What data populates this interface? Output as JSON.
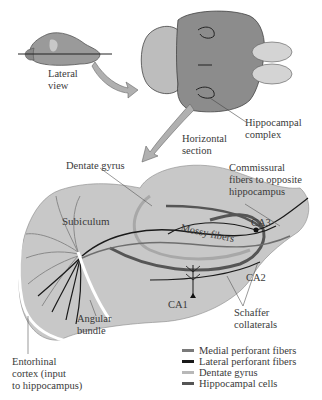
{
  "figure": {
    "labels": {
      "lateral_view": "Lateral\nview",
      "horizontal_section": "Horizontal\nsection",
      "hippocampal_complex": "Hippocampal\ncomplex",
      "dentate_gyrus": "Dentate gyrus",
      "commissural_fibers": "Commissural\nfibers to opposite\nhippocampus",
      "subiculum": "Subiculum",
      "mossy_fibers": "Mossy fibers",
      "ca3": "CA3",
      "ca2": "CA2",
      "ca1": "CA1",
      "schaffer_collaterals": "Schaffer\ncollaterals",
      "angular_bundle": "Angular\nbundle",
      "entorhinal_cortex": "Entorhinal\ncortex (input\nto hippocampus)"
    },
    "legend": [
      {
        "label": "Medial perforant fibers",
        "color": "#7a7a7a"
      },
      {
        "label": "Lateral perforant fibers",
        "color": "#1a1a1a"
      },
      {
        "label": "Dentate gyrus",
        "color": "#b8b8b8"
      },
      {
        "label": "Hippocampal cells",
        "color": "#555555"
      }
    ],
    "colors": {
      "tissue_fill": "#c8c8c8",
      "brain_fill": "#8c8c8c",
      "arrow_fill": "#b0b0b0"
    }
  }
}
